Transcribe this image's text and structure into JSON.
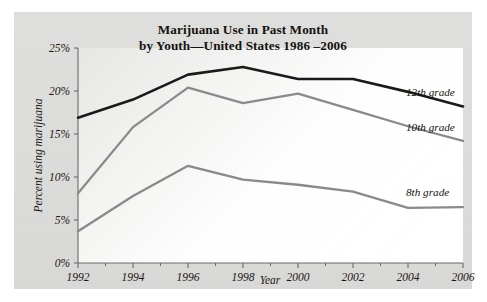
{
  "chart_data": {
    "type": "line",
    "title": "Marijuana Use in Past Month by Youth—United States 1986 –2006",
    "title_line1": "Marijuana Use in Past Month",
    "title_line2": "by Youth—United States 1986 –2006",
    "xlabel": "Year",
    "ylabel": "Percent using marijuana",
    "x": [
      1992,
      1993,
      1994,
      1995,
      1996,
      1997,
      1998,
      1999,
      2000,
      2001,
      2002,
      2003,
      2004,
      2005,
      2006
    ],
    "categories": [
      "1992",
      "1994",
      "1996",
      "1998",
      "2000",
      "2002",
      "2004",
      "2006"
    ],
    "xlim": [
      1992,
      2006
    ],
    "ylim": [
      0,
      25
    ],
    "ytick_labels": [
      "0%",
      "5%",
      "10%",
      "15%",
      "20%",
      "25%"
    ],
    "ytick_values": [
      0,
      5,
      10,
      15,
      20,
      25
    ],
    "xtick_labels": [
      "1992",
      "1994",
      "1996",
      "1998",
      "2000",
      "2002",
      "2004",
      "2006"
    ],
    "xtick_values": [
      1992,
      1994,
      1996,
      1998,
      2000,
      2002,
      2004,
      2006
    ],
    "xtick_minor_values": [
      1993,
      1995,
      1997,
      1999,
      2001,
      2003,
      2005
    ],
    "grid": false,
    "legend_position": "inline-right",
    "series": [
      {
        "name": "12th grade",
        "label": "12th grade",
        "color": "#1a1a1a",
        "width": 2.6,
        "x": [
          1992,
          1994,
          1996,
          1998,
          2000,
          2002,
          2004,
          2006
        ],
        "values": [
          16.9,
          19.0,
          21.9,
          22.8,
          21.4,
          21.4,
          19.9,
          18.2
        ]
      },
      {
        "name": "10th grade",
        "label": "10th grade",
        "color": "#8a8a8a",
        "width": 2.3,
        "x": [
          1992,
          1994,
          1996,
          1998,
          2000,
          2002,
          2004,
          2006
        ],
        "values": [
          8.1,
          15.8,
          20.4,
          18.6,
          19.7,
          17.8,
          15.9,
          14.2
        ]
      },
      {
        "name": "8th grade",
        "label": "8th grade",
        "color": "#8a8a8a",
        "width": 2.3,
        "x": [
          1992,
          1994,
          1996,
          1998,
          2000,
          2002,
          2004,
          2006
        ],
        "values": [
          3.7,
          7.8,
          11.3,
          9.7,
          9.1,
          8.3,
          6.4,
          6.5
        ]
      }
    ]
  },
  "colors": {
    "figure_background": "#dcdcda",
    "plot_background": "#ffffff",
    "axis": "#6d6a66",
    "text": "#1b1714",
    "series_dark": "#1a1a1a",
    "series_gray": "#8a8a8a"
  }
}
